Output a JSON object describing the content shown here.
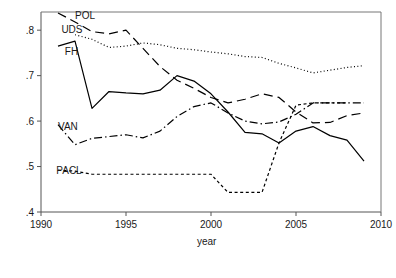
{
  "chart_data": {
    "type": "line",
    "title": "",
    "xlabel": "year",
    "ylabel": "",
    "xlim": [
      1990,
      2010
    ],
    "ylim": [
      0.4,
      0.84
    ],
    "grid": false,
    "legend": "inline-labels",
    "xticks": [
      1990,
      1995,
      2000,
      2005,
      2010
    ],
    "xticklabels": [
      "1990",
      "1995",
      "2000",
      "2005",
      "2010"
    ],
    "yticks": [
      0.4,
      0.5,
      0.6,
      0.7,
      0.8
    ],
    "yticklabels": [
      ".4",
      ".5",
      ".6",
      ".7",
      ".8"
    ],
    "series": [
      {
        "name": "POL",
        "label": "POL",
        "style": "long-dash",
        "color": "#000000",
        "label_x": 1992.0,
        "label_y": 0.825,
        "x": [
          1991,
          1992,
          1993,
          1994,
          1995,
          1996,
          1997,
          1998,
          1999,
          2000,
          2001,
          2002,
          2003,
          2004,
          2005,
          2006,
          2007,
          2008,
          2009
        ],
        "y": [
          0.838,
          0.818,
          0.797,
          0.792,
          0.8,
          0.76,
          0.72,
          0.69,
          0.672,
          0.652,
          0.64,
          0.648,
          0.66,
          0.652,
          0.62,
          0.596,
          0.597,
          0.612,
          0.618
        ]
      },
      {
        "name": "UDS",
        "label": "UDS",
        "style": "dotted",
        "color": "#000000",
        "label_x": 1991.2,
        "label_y": 0.793,
        "x": [
          1992,
          1993,
          1994,
          1995,
          1996,
          1997,
          1998,
          1999,
          2000,
          2001,
          2002,
          2003,
          2004,
          2005,
          2006,
          2007,
          2008,
          2009
        ],
        "y": [
          0.79,
          0.78,
          0.762,
          0.765,
          0.772,
          0.768,
          0.76,
          0.757,
          0.752,
          0.748,
          0.742,
          0.74,
          0.727,
          0.717,
          0.706,
          0.712,
          0.718,
          0.722
        ]
      },
      {
        "name": "FH",
        "label": "FH",
        "style": "solid",
        "color": "#000000",
        "label_x": 1991.4,
        "label_y": 0.745,
        "x": [
          1991,
          1992,
          1993,
          1994,
          1995,
          1996,
          1997,
          1998,
          1999,
          2000,
          2001,
          2002,
          2003,
          2004,
          2005,
          2006,
          2007,
          2008,
          2009
        ],
        "y": [
          0.765,
          0.776,
          0.628,
          0.665,
          0.662,
          0.66,
          0.668,
          0.7,
          0.688,
          0.66,
          0.62,
          0.575,
          0.572,
          0.552,
          0.578,
          0.588,
          0.568,
          0.558,
          0.512
        ]
      },
      {
        "name": "VAN",
        "label": "VAN",
        "style": "dash-dot",
        "color": "#000000",
        "label_x": 1991.0,
        "label_y": 0.58,
        "x": [
          1991,
          1992,
          1993,
          1994,
          1995,
          1996,
          1997,
          1998,
          1999,
          2000,
          2001,
          2002,
          2003,
          2004,
          2005,
          2006,
          2007,
          2008,
          2009
        ],
        "y": [
          0.592,
          0.548,
          0.562,
          0.566,
          0.57,
          0.563,
          0.578,
          0.61,
          0.632,
          0.64,
          0.618,
          0.6,
          0.594,
          0.598,
          0.615,
          0.64,
          0.64,
          0.64,
          0.64
        ]
      },
      {
        "name": "PACL",
        "label": "PACL",
        "style": "short-dash",
        "color": "#000000",
        "label_x": 1990.9,
        "label_y": 0.483,
        "x": [
          1991,
          1992,
          1993,
          1994,
          1995,
          1996,
          1997,
          1998,
          1999,
          2000,
          2001,
          2002,
          2003,
          2004,
          2005,
          2006,
          2007,
          2008
        ],
        "y": [
          0.492,
          0.49,
          0.483,
          0.483,
          0.483,
          0.483,
          0.483,
          0.483,
          0.483,
          0.483,
          0.443,
          0.443,
          0.443,
          0.552,
          0.635,
          0.64,
          0.64,
          0.64
        ]
      }
    ]
  }
}
